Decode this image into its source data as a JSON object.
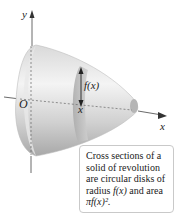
{
  "figure": {
    "axis_labels": {
      "y": "y",
      "x": "x",
      "origin": "O"
    },
    "radius_label": "f(x)",
    "section_label": "x",
    "caption": {
      "line1": "Cross sections of a",
      "line2": "solid of revolution",
      "line3": "are circular disks of",
      "line4_pre": "radius ",
      "line4_fx": "f(x)",
      "line4_post": " and area",
      "line5": "πf(x)²."
    },
    "colors": {
      "solid_light": "#f2f2f2",
      "solid_mid": "#c8c8c8",
      "solid_dark": "#9a9a9a",
      "axis": "#333333"
    }
  }
}
